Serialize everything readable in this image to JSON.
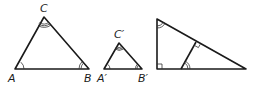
{
  "diagram": {
    "colors": {
      "line": "#1a1a1a",
      "background": "#ffffff"
    },
    "triangles": [
      {
        "id": "ABC",
        "vertices": {
          "A": [
            15,
            69
          ],
          "B": [
            89,
            69
          ],
          "C": [
            44,
            17
          ]
        },
        "labels": [
          {
            "text": "A",
            "x": 8,
            "y": 82
          },
          {
            "text": "B",
            "x": 84,
            "y": 82
          },
          {
            "text": "C",
            "x": 40,
            "y": 12
          }
        ],
        "angle_marks": {
          "A": 1,
          "B": 2,
          "C": 3
        }
      },
      {
        "id": "A'B'C'",
        "vertices": {
          "A'": [
            104,
            69
          ],
          "B'": [
            142,
            69
          ],
          "C'": [
            119,
            43
          ]
        },
        "labels": [
          {
            "text": "A′",
            "x": 97,
            "y": 82
          },
          {
            "text": "B′",
            "x": 138,
            "y": 82
          },
          {
            "text": "C′",
            "x": 114,
            "y": 38
          }
        ],
        "angle_marks": {
          "A'": 1,
          "B'": 2,
          "C'": 3
        }
      },
      {
        "id": "right-triangle",
        "vertices": {
          "top": [
            157,
            19
          ],
          "right_angle": [
            157,
            69
          ],
          "right": [
            246,
            69
          ]
        },
        "altitude": {
          "from": [
            181,
            69
          ],
          "to": [
            196,
            42
          ]
        },
        "marks": [
          "right-angle at bottom-left",
          "right-angle at altitude foot",
          "double arc at top vertex",
          "double arc at altitude base"
        ]
      }
    ]
  }
}
